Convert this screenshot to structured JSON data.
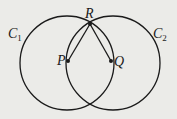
{
  "diagram": {
    "circles": [
      {
        "name": "C",
        "subscript": "1",
        "cx": 67,
        "cy": 63,
        "r": 47
      },
      {
        "name": "C",
        "subscript": "2",
        "cx": 113,
        "cy": 63,
        "r": 47
      }
    ],
    "points": [
      {
        "label": "P",
        "x": 68,
        "y": 61
      },
      {
        "label": "Q",
        "x": 111,
        "y": 61
      },
      {
        "label": "R",
        "x": 90,
        "y": 24
      }
    ],
    "segments": [
      [
        "R",
        "P"
      ],
      [
        "R",
        "Q"
      ]
    ],
    "colors": {
      "stroke": "#1a1a1a",
      "background": "#ebebe8"
    }
  }
}
